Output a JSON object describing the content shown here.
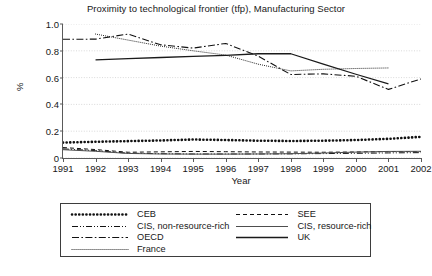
{
  "chart_data": {
    "type": "line",
    "title": "Proximity to technological frontier (tfp), Manufacturing Sector",
    "xlabel": "Year",
    "ylabel": "%",
    "x": [
      1991,
      1992,
      1993,
      1994,
      1995,
      1996,
      1997,
      1998,
      1999,
      2000,
      2001,
      2002
    ],
    "xlim": [
      1991,
      2002
    ],
    "ylim": [
      0,
      1.0
    ],
    "xticks": [
      "1991",
      "1992",
      "1993",
      "1994",
      "1995",
      "1996",
      "1997",
      "1998",
      "1999",
      "2000",
      "2001",
      "2002"
    ],
    "yticks": [
      "0",
      "0.2",
      "0.4",
      "0.6",
      "0.8",
      "1.0"
    ],
    "ytick_values": [
      0,
      0.2,
      0.4,
      0.6,
      0.8,
      1.0
    ],
    "grid": true,
    "grid_axis": "y",
    "legend_position": "below-plot",
    "legend_columns": 2,
    "series": [
      {
        "name": "CEB",
        "style": "thick-dotted",
        "color": "#111111",
        "x": [
          1991,
          1992,
          1993,
          1994,
          1995,
          1996,
          1997,
          1998,
          1999,
          2000,
          2001,
          2002
        ],
        "values": [
          0.115,
          0.121,
          0.126,
          0.131,
          0.138,
          0.134,
          0.129,
          0.127,
          0.129,
          0.134,
          0.143,
          0.158
        ]
      },
      {
        "name": "SEE",
        "style": "dashed",
        "color": "#111111",
        "x": [
          1991,
          1992,
          1993,
          1994,
          1995,
          1996,
          1997,
          1998,
          1999,
          2000,
          2001,
          2002
        ],
        "values": [
          0.078,
          0.063,
          0.043,
          0.046,
          0.049,
          0.047,
          0.045,
          0.044,
          0.043,
          0.045,
          0.048,
          0.047
        ]
      },
      {
        "name": "CIS, non-resource-rich",
        "style": "dash-dot-dot",
        "color": "#111111",
        "x": [
          1991,
          1992,
          1993,
          1994,
          1995,
          1996,
          1997,
          1998,
          1999,
          2000,
          2001,
          2002
        ],
        "values": [
          0.068,
          0.055,
          0.036,
          0.032,
          0.03,
          0.03,
          0.03,
          0.031,
          0.033,
          0.035,
          0.038,
          0.04
        ]
      },
      {
        "name": "CIS, resource-rich",
        "style": "thin-solid",
        "color": "#4e4e4e",
        "x": [
          1991,
          1992,
          1993,
          1994,
          1995,
          1996,
          1997,
          1998,
          1999,
          2000,
          2001,
          2002
        ],
        "values": [
          0.062,
          0.05,
          0.034,
          0.03,
          0.029,
          0.029,
          0.03,
          0.032,
          0.037,
          0.044,
          0.049,
          0.05
        ]
      },
      {
        "name": "OECD",
        "style": "dash-dot",
        "color": "#111111",
        "x": [
          1991,
          1992,
          1993,
          1994,
          1995,
          1996,
          1997,
          1998,
          1999,
          2000,
          2001,
          2002
        ],
        "values": [
          0.886,
          0.887,
          0.925,
          0.845,
          0.82,
          0.855,
          0.76,
          0.623,
          0.628,
          0.61,
          0.512,
          0.59
        ],
        "note": "peaks 0.925 at 1993, local min 0.512 at 2001, rebound then final 0.51 at 2002"
      },
      {
        "name": "France",
        "style": "fine-dotted",
        "color": "#111111",
        "x": [
          1992,
          1993,
          1994,
          1995,
          1996,
          1997,
          1998,
          1999,
          2000,
          2001
        ],
        "values": [
          0.925,
          0.88,
          0.835,
          0.8,
          0.768,
          0.7,
          0.65,
          0.662,
          0.668,
          0.672
        ]
      },
      {
        "name": "UK",
        "style": "solid",
        "color": "#1a1a1a",
        "x": [
          1992,
          1993,
          1994,
          1995,
          1996,
          1997,
          1998,
          1999,
          2000,
          2001
        ],
        "values": [
          0.733,
          0.742,
          0.75,
          0.758,
          0.766,
          0.778,
          0.778,
          0.7,
          0.625,
          0.553
        ]
      }
    ]
  },
  "legend": {
    "entries": [
      {
        "label": "CEB",
        "style": "thick-dotted"
      },
      {
        "label": "SEE",
        "style": "dashed"
      },
      {
        "label": "CIS, non-resource-rich",
        "style": "dash-dot-dot"
      },
      {
        "label": "CIS, resource-rich",
        "style": "thin-solid"
      },
      {
        "label": "OECD",
        "style": "dash-dot"
      },
      {
        "label": "UK",
        "style": "solid"
      },
      {
        "label": "France",
        "style": "fine-dotted"
      }
    ]
  },
  "colors": {
    "axis": "#5a5a5a",
    "grid": "#cfcfcf",
    "text": "#181818",
    "line": "#111111",
    "legend_border": "#3d3d3d",
    "background": "#ffffff"
  }
}
